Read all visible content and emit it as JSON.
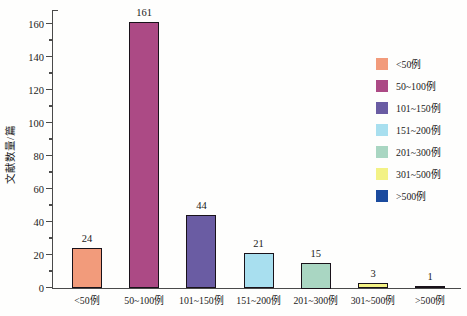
{
  "chart_data": {
    "type": "bar",
    "title": "",
    "xlabel": "",
    "ylabel": "文献数量/篇",
    "categories": [
      "<50例",
      "50~100例",
      "101~150例",
      "151~200例",
      "201~300例",
      "301~500例",
      ">500例"
    ],
    "values": [
      24,
      161,
      44,
      21,
      15,
      3,
      1
    ],
    "value_labels": [
      "24",
      "161",
      "44",
      "21",
      "15",
      "3",
      "1"
    ],
    "ylim": [
      0,
      160
    ],
    "ytick_interval": 20,
    "yminor_interval": 10,
    "ytick_labels": [
      "0",
      "20",
      "40",
      "60",
      "80",
      "100",
      "120",
      "140",
      "160"
    ],
    "grid": false,
    "legend_position": "right",
    "bar_colors": [
      "#F29B7B",
      "#AC4A85",
      "#6A5CA3",
      "#A8DFEF",
      "#A9D6C2",
      "#F3F285",
      "#1B4B9E"
    ],
    "bar_border_color": "#19121a",
    "axis_color": "#4a4a4a",
    "background_color": "#fefefd"
  },
  "legend": {
    "items": [
      {
        "label": "<50例",
        "color": "#F29B7B"
      },
      {
        "label": "50~100例",
        "color": "#AC4A85"
      },
      {
        "label": "101~150例",
        "color": "#6A5CA3"
      },
      {
        "label": "151~200例",
        "color": "#A8DFEF"
      },
      {
        "label": "201~300例",
        "color": "#A9D6C2"
      },
      {
        "label": "301~500例",
        "color": "#F3F285"
      },
      {
        "label": ">500例",
        "color": "#1B4B9E"
      }
    ]
  }
}
